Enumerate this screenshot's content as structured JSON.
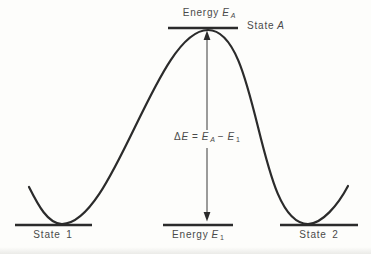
{
  "diagram": {
    "type": "energy-barrier-diagram",
    "labels": {
      "energy_a": {
        "word": "Energy",
        "symbol": "E",
        "sub": "A"
      },
      "state_a": {
        "word": "State",
        "symbol": "A"
      },
      "formula": {
        "delta": "Δ",
        "delta_e": "E",
        "equals": "=",
        "e_a": "E",
        "e_a_sub": "A",
        "minus": "−",
        "e_1": "E",
        "e_1_sub": "1"
      },
      "state_1": "State 1",
      "energy_1": {
        "word": "Energy",
        "symbol": "E",
        "sub": "1"
      },
      "state_2": "State 2"
    },
    "colors": {
      "background": "#fdfdfb",
      "line": "#2b2b2b",
      "arrow": "#5a5a5a",
      "text": "#4a4a4a"
    }
  }
}
